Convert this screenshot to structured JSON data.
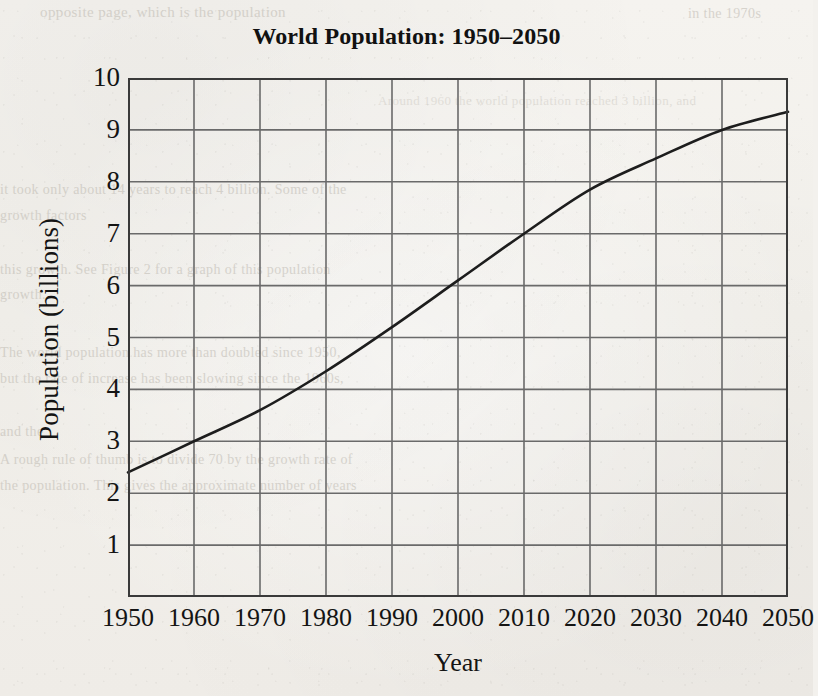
{
  "chart_data": {
    "type": "line",
    "title": "World Population: 1950–2050",
    "xlabel": "Year",
    "ylabel": "Population (billions)",
    "x": [
      1950,
      1960,
      1970,
      1980,
      1990,
      2000,
      2010,
      2020,
      2030,
      2040,
      2050
    ],
    "values": [
      2.4,
      3.0,
      3.6,
      4.35,
      5.2,
      6.1,
      7.0,
      7.85,
      8.45,
      9.0,
      9.35
    ],
    "series": [
      {
        "name": "World population",
        "values": [
          2.4,
          3.0,
          3.6,
          4.35,
          5.2,
          6.1,
          7.0,
          7.85,
          8.45,
          9.0,
          9.35
        ]
      }
    ],
    "xlim": [
      1950,
      2050
    ],
    "ylim": [
      0,
      10
    ],
    "xticks": [
      1950,
      1960,
      1970,
      1980,
      1990,
      2000,
      2010,
      2020,
      2030,
      2040,
      2050
    ],
    "xtick_labels": [
      "1950",
      "1960",
      "1970",
      "1980",
      "1990",
      "2000",
      "2010",
      "2020",
      "2030",
      "2040",
      "2050"
    ],
    "yticks": [
      1,
      2,
      3,
      4,
      5,
      6,
      7,
      8,
      9,
      10
    ],
    "ytick_labels": [
      "1",
      "2",
      "3",
      "4",
      "5",
      "6",
      "7",
      "8",
      "9",
      "10"
    ],
    "grid": true,
    "legend": "none",
    "line_color": "#1d1d1d",
    "grid_color": "#6a6a6a",
    "frame_color": "#3a3a3a",
    "background_color": "#f2f0ec"
  },
  "page": {
    "bleed_text": [
      "opposite page, which is the population",
      "in the 1970s",
      "Around 1960 the world population reached 3 billion, and",
      "it took only about 14 years to reach 4 billion. Some of the",
      "growth factors",
      "this growth. See Figure 2 for a graph of this population",
      "growth.",
      "The world population has more than doubled since 1950,",
      "but the rate of increase has been slowing since the 1960s,",
      "and the",
      "A rough rule of thumb is to divide 70 by the growth rate of",
      "the population. This gives the approximate number of years"
    ]
  }
}
